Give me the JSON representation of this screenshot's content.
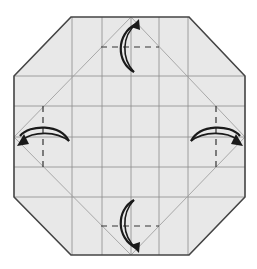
{
  "diagram": {
    "type": "origami-fold-diagram",
    "colors": {
      "background": "#ffffff",
      "paper": "#e8e8e8",
      "outline": "#444444",
      "grid": "#8a8a8a",
      "diagonal": "#a0a0a0",
      "dash": "#333333",
      "arrow": "#1a1a1a"
    },
    "octagon_points": [
      [
        71,
        17
      ],
      [
        189,
        17
      ],
      [
        245,
        76
      ],
      [
        245,
        197
      ],
      [
        189,
        255
      ],
      [
        71,
        255
      ],
      [
        14,
        197
      ],
      [
        14,
        76
      ]
    ],
    "grid": {
      "vertical_x": [
        72,
        102,
        131,
        159,
        188
      ],
      "horizontal_y": [
        76,
        106,
        137,
        167,
        197
      ],
      "top": 17,
      "bottom": 255,
      "left": 14,
      "right": 245
    },
    "diagonal_square": [
      [
        131,
        17
      ],
      [
        245,
        137
      ],
      [
        131,
        255
      ],
      [
        14,
        137
      ]
    ],
    "dashed_lines": [
      {
        "name": "top",
        "x1": 101,
        "y1": 47,
        "x2": 159,
        "y2": 47
      },
      {
        "name": "bottom",
        "x1": 101,
        "y1": 226,
        "x2": 159,
        "y2": 226
      },
      {
        "name": "left",
        "x1": 43,
        "y1": 106,
        "x2": 43,
        "y2": 167
      },
      {
        "name": "right",
        "x1": 216,
        "y1": 106,
        "x2": 216,
        "y2": 167
      }
    ],
    "arrows": [
      {
        "name": "top",
        "direction": "up"
      },
      {
        "name": "bottom",
        "direction": "down"
      },
      {
        "name": "left",
        "direction": "left"
      },
      {
        "name": "right",
        "direction": "right"
      }
    ]
  }
}
